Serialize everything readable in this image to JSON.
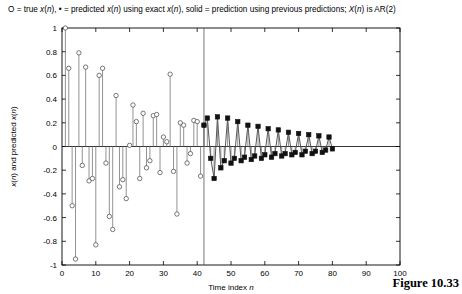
{
  "figure": {
    "number_label": "Figure 10.33",
    "caption": "O = true x(n), • = predicted x(n) using exact x(n), solid = prediction using previous predictions; X(n) is AR(2)"
  },
  "chart_data": {
    "type": "line",
    "title": "O = true x(n), • = predicted x(n) using exact x(n), solid = prediction using previous predictions; X(n) is AR(2)",
    "xlabel": "Time index n",
    "ylabel": "x(n) and predicted x(n)",
    "xlim": [
      0,
      100
    ],
    "ylim": [
      -1,
      1
    ],
    "xticks": [
      0,
      10,
      20,
      30,
      40,
      50,
      60,
      70,
      80,
      90,
      100
    ],
    "xticklabels": [
      "0",
      "10",
      "20",
      "30",
      "40",
      "50",
      "60",
      "70",
      "80",
      "90",
      "100"
    ],
    "yticks": [
      -1,
      -0.8,
      -0.6,
      -0.4,
      -0.2,
      0,
      0.2,
      0.4,
      0.6,
      0.8,
      1
    ],
    "yticklabels": [
      "-1",
      "-0.8",
      "-0.6",
      "-0.4",
      "-0.2",
      "0",
      "0.2",
      "0.4",
      "0.6",
      "0.8",
      "1"
    ],
    "grid": false,
    "legend": "none",
    "annotations": [
      {
        "name": "split-line",
        "type": "vline",
        "x": 42,
        "label": "prediction start"
      }
    ],
    "series": [
      {
        "name": "true x(n) and prediction using exact x(n)",
        "marker": "open-circle",
        "style": "stem",
        "x": [
          1,
          2,
          3,
          4,
          5,
          6,
          7,
          8,
          9,
          10,
          11,
          12,
          13,
          14,
          15,
          16,
          17,
          18,
          19,
          20,
          21,
          22,
          23,
          24,
          25,
          26,
          27,
          28,
          29,
          30,
          31,
          32,
          33,
          34,
          35,
          36,
          37,
          38,
          39,
          40,
          41,
          42
        ],
        "values": [
          1.0,
          0.66,
          -0.5,
          -0.95,
          0.79,
          -0.16,
          0.67,
          -0.29,
          -0.27,
          -0.83,
          0.6,
          0.66,
          -0.14,
          -0.59,
          -0.7,
          0.43,
          -0.34,
          -0.28,
          -0.44,
          0.01,
          0.35,
          0.21,
          -0.27,
          0.28,
          -0.18,
          -0.12,
          0.26,
          0.27,
          -0.22,
          0.08,
          0.04,
          0.61,
          -0.21,
          -0.57,
          0.2,
          0.18,
          -0.14,
          -0.06,
          0.22,
          0.21,
          -0.25,
          0.18
        ]
      },
      {
        "name": "prediction using previous predictions",
        "marker": "filled-square",
        "style": "line",
        "x": [
          42,
          43,
          44,
          45,
          46,
          47,
          48,
          49,
          50,
          51,
          52,
          53,
          54,
          55,
          56,
          57,
          58,
          59,
          60,
          61,
          62,
          63,
          64,
          65,
          66,
          67,
          68,
          69,
          70,
          71,
          72,
          73,
          74,
          75,
          76,
          77,
          78,
          79,
          80
        ],
        "values": [
          0.18,
          0.24,
          -0.1,
          -0.27,
          0.25,
          -0.18,
          -0.12,
          0.24,
          -0.14,
          -0.1,
          0.21,
          -0.12,
          -0.09,
          0.18,
          -0.11,
          -0.08,
          0.17,
          -0.1,
          -0.07,
          0.15,
          -0.09,
          -0.06,
          0.14,
          -0.08,
          -0.06,
          0.12,
          -0.07,
          -0.05,
          0.11,
          -0.07,
          -0.04,
          0.1,
          -0.06,
          -0.04,
          0.09,
          -0.05,
          -0.03,
          0.08,
          -0.02
        ]
      }
    ]
  }
}
